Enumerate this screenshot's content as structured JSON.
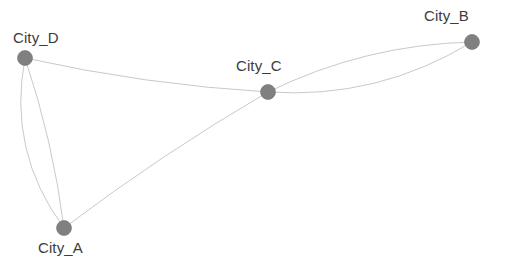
{
  "graph": {
    "title": "City network graph",
    "background_color": "#ffffff",
    "node_color": "#808080",
    "node_stroke_color": "#6e6e6e",
    "edge_color": "#c9c9c9",
    "label_color": "#3c3c3c",
    "node_radius": 7.5,
    "edge_width": 1,
    "nodes": [
      {
        "id": "City_A",
        "label": "City_A",
        "x": 64,
        "y": 228,
        "label_x": 38,
        "label_y": 240
      },
      {
        "id": "City_B",
        "label": "City_B",
        "x": 472,
        "y": 42,
        "label_x": 424,
        "label_y": 8
      },
      {
        "id": "City_C",
        "label": "City_C",
        "x": 268,
        "y": 92,
        "label_x": 236,
        "label_y": 58
      },
      {
        "id": "City_D",
        "label": "City_D",
        "x": 25,
        "y": 58,
        "label_x": 13,
        "label_y": 30
      }
    ],
    "edges": [
      {
        "source": "City_D",
        "target": "City_C",
        "curvature": 0.04,
        "kind": "single"
      },
      {
        "source": "City_A",
        "target": "City_C",
        "curvature": -0.03,
        "kind": "single"
      },
      {
        "source": "City_D",
        "target": "City_A",
        "curvature": 0.22,
        "kind": "parallel-1"
      },
      {
        "source": "City_D",
        "target": "City_A",
        "curvature": -0.05,
        "kind": "parallel-2"
      },
      {
        "source": "City_C",
        "target": "City_B",
        "curvature": 0.16,
        "kind": "parallel-1"
      },
      {
        "source": "City_C",
        "target": "City_B",
        "curvature": -0.11,
        "kind": "parallel-2"
      }
    ]
  }
}
